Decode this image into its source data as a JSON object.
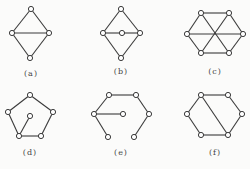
{
  "figure": {
    "colors": {
      "background": "#fbfbfa",
      "stroke": "#3a3a3a",
      "node_fill": "#ffffff",
      "label": "#444444"
    },
    "node_radius": 2.6,
    "graphs": [
      {
        "id": "a",
        "label": "(a)",
        "label_pos": [
          31,
          69
        ],
        "nodes": [
          [
            31,
            9
          ],
          [
            12,
            33
          ],
          [
            49,
            33
          ],
          [
            30,
            58
          ]
        ],
        "edges": [
          [
            0,
            1
          ],
          [
            0,
            2
          ],
          [
            1,
            2
          ],
          [
            1,
            3
          ],
          [
            2,
            3
          ]
        ]
      },
      {
        "id": "b",
        "label": "(b)",
        "label_pos": [
          121,
          67
        ],
        "nodes": [
          [
            121,
            9
          ],
          [
            103,
            33
          ],
          [
            122,
            33
          ],
          [
            140,
            33
          ],
          [
            121,
            58
          ]
        ],
        "edges": [
          [
            0,
            1
          ],
          [
            0,
            3
          ],
          [
            1,
            2
          ],
          [
            2,
            3
          ],
          [
            1,
            4
          ],
          [
            3,
            4
          ]
        ]
      },
      {
        "id": "c",
        "label": "(c)",
        "label_pos": [
          215,
          67
        ],
        "nodes": [
          [
            201,
            13
          ],
          [
            229,
            13
          ],
          [
            187,
            34
          ],
          [
            243,
            34
          ],
          [
            201,
            53
          ],
          [
            229,
            53
          ]
        ],
        "edges": [
          [
            0,
            1
          ],
          [
            0,
            2
          ],
          [
            1,
            3
          ],
          [
            2,
            4
          ],
          [
            3,
            5
          ],
          [
            4,
            5
          ],
          [
            0,
            5
          ],
          [
            1,
            4
          ],
          [
            2,
            3
          ]
        ]
      },
      {
        "id": "d",
        "label": "(d)",
        "label_pos": [
          30,
          148
        ],
        "nodes": [
          [
            30,
            95
          ],
          [
            8,
            112
          ],
          [
            53,
            112
          ],
          [
            19,
            136
          ],
          [
            41,
            136
          ],
          [
            30,
            116
          ]
        ],
        "edges": [
          [
            0,
            1
          ],
          [
            0,
            2
          ],
          [
            1,
            3
          ],
          [
            2,
            4
          ],
          [
            3,
            4
          ],
          [
            5,
            3
          ]
        ]
      },
      {
        "id": "e",
        "label": "(e)",
        "label_pos": [
          121,
          148
        ],
        "nodes": [
          [
            109,
            95
          ],
          [
            136,
            95
          ],
          [
            94,
            114
          ],
          [
            123,
            114
          ],
          [
            149,
            114
          ],
          [
            108,
            137
          ],
          [
            134,
            137
          ]
        ],
        "edges": [
          [
            0,
            1
          ],
          [
            0,
            2
          ],
          [
            1,
            4
          ],
          [
            2,
            3
          ],
          [
            2,
            5
          ],
          [
            4,
            6
          ]
        ]
      },
      {
        "id": "f",
        "label": "(f)",
        "label_pos": [
          215,
          148
        ],
        "nodes": [
          [
            201,
            95
          ],
          [
            228,
            95
          ],
          [
            187,
            114
          ],
          [
            242,
            114
          ],
          [
            201,
            135
          ],
          [
            228,
            135
          ]
        ],
        "edges": [
          [
            0,
            1
          ],
          [
            0,
            2
          ],
          [
            1,
            3
          ],
          [
            2,
            4
          ],
          [
            3,
            5
          ],
          [
            4,
            5
          ],
          [
            0,
            5
          ]
        ]
      }
    ]
  }
}
